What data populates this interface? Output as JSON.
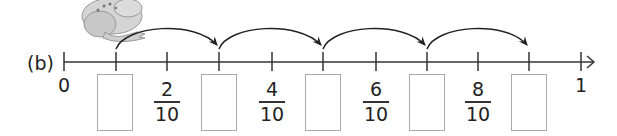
{
  "part_label": "(b)",
  "number_line": {
    "start_label": "0",
    "end_label": "1",
    "tick_x": [
      64,
      116,
      167,
      219,
      272,
      323,
      376,
      427,
      478,
      529,
      581
    ],
    "axis_y": 62
  },
  "fractions": [
    {
      "numerator": "2",
      "denominator": "10",
      "x": 167
    },
    {
      "numerator": "4",
      "denominator": "10",
      "x": 272
    },
    {
      "numerator": "6",
      "denominator": "10",
      "x": 376
    },
    {
      "numerator": "8",
      "denominator": "10",
      "x": 478
    }
  ],
  "answer_boxes": [
    {
      "x": 116,
      "value": ""
    },
    {
      "x": 219,
      "value": ""
    },
    {
      "x": 323,
      "value": ""
    },
    {
      "x": 427,
      "value": ""
    },
    {
      "x": 529,
      "value": ""
    }
  ],
  "jumps": [
    {
      "from": 116,
      "to": 219
    },
    {
      "from": 219,
      "to": 323
    },
    {
      "from": 323,
      "to": 427
    },
    {
      "from": 427,
      "to": 529
    }
  ],
  "colors": {
    "line": "#333333",
    "box_border": "#aaaaaa",
    "frog": "#bdbdbd"
  }
}
